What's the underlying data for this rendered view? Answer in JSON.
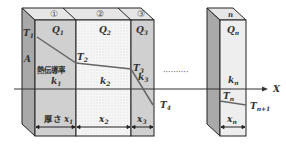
{
  "diagram": {
    "layer_numbers": [
      "①",
      "②",
      "③"
    ],
    "last_layer_number": "n",
    "heat_flows": [
      "Q",
      "Q",
      "Q",
      "Q"
    ],
    "heat_flow_subs": [
      "1",
      "2",
      "3",
      "n"
    ],
    "temperatures": [
      "T",
      "T",
      "T",
      "T",
      "T",
      "T"
    ],
    "temperature_subs": [
      "1",
      "2",
      "3",
      "4",
      "n",
      "n+1"
    ],
    "conductivity_label": "熱伝導率",
    "conductivities": [
      "k",
      "k",
      "k",
      "k"
    ],
    "conductivity_subs": [
      "1",
      "2",
      "3",
      "n"
    ],
    "thickness_label": "厚さ",
    "thicknesses": [
      "x",
      "x",
      "x",
      "x"
    ],
    "thickness_subs": [
      "1",
      "2",
      "3",
      "n"
    ],
    "area_label": "A",
    "axis_label": "X",
    "ellipsis": "··········",
    "colors": {
      "slab_shaded": "#cfcfcf",
      "slab_dotted": "#f3f3f3",
      "side_face": "#a9a9a9",
      "top_face": "#e4e4e4",
      "line": "#222222",
      "temp_line": "#666666"
    }
  }
}
